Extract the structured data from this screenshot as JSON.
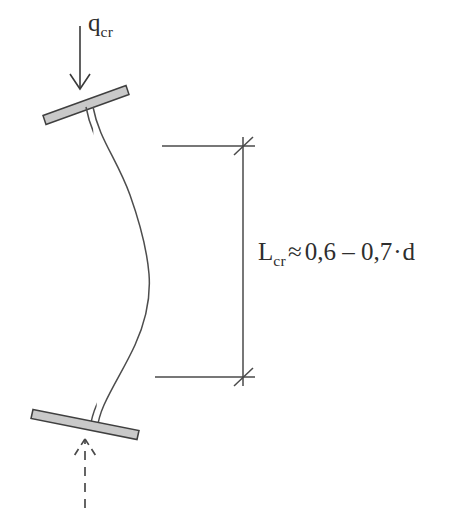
{
  "figure": {
    "type": "engineering-diagram",
    "background_color": "#ffffff",
    "ink_color": "#3a3a3a",
    "plate_fill_color": "#c9c9c9",
    "plate_outline_color": "#3f3f3f"
  },
  "load": {
    "symbol": "q",
    "subscript": "cr",
    "arrow_direction": "down",
    "arrow_style": "solid",
    "arrowhead": "open-v"
  },
  "reaction": {
    "arrow_direction": "up",
    "arrow_style": "dashed",
    "arrowhead": "open-v-dashed"
  },
  "dimension": {
    "symbol": "L",
    "subscript": "cr",
    "relation": "≈",
    "value_low": "0,6",
    "range_dash": "–",
    "value_high": "0,7",
    "multiply": "·",
    "variable": "d",
    "full_text": "L_cr ≈ 0,6 – 0,7·d",
    "tick_style": "architectural-slash",
    "orientation": "vertical"
  },
  "members": {
    "top_plate_label": "top-bearing-plate",
    "bottom_plate_label": "bottom-bearing-plate",
    "column_label": "buckled-column",
    "column_shape": "double-curvature-s-curve"
  }
}
